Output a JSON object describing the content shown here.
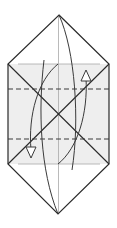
{
  "diagram": {
    "type": "origami-fold-diagram",
    "colors": {
      "background": "#ffffff",
      "fill_shaded": "#eeeeee",
      "outline": "#2a2a2a",
      "crease": "#a0a0a0",
      "dashed_fold": "#3a3a3a",
      "arrow": "#3a3a3a"
    },
    "shape": {
      "top_apex": [
        59,
        15
      ],
      "left_top": [
        8,
        64
      ],
      "right_top": [
        109,
        64
      ],
      "left_bottom": [
        8,
        164
      ],
      "right_bottom": [
        109,
        164
      ],
      "bottom_apex": [
        58,
        214
      ],
      "center": [
        58,
        114
      ]
    },
    "valley_folds_y": [
      89,
      139
    ],
    "arrows": [
      {
        "name": "fold-down-arrow",
        "direction": "down-left"
      },
      {
        "name": "fold-up-arrow",
        "direction": "up-right"
      }
    ]
  }
}
